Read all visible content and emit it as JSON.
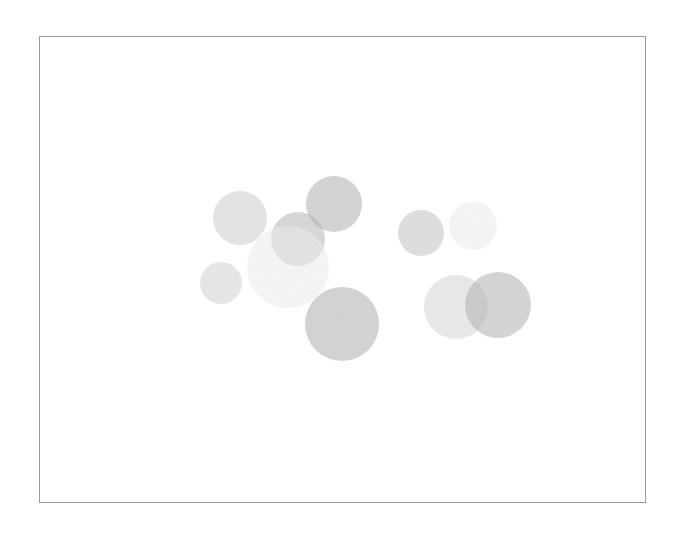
{
  "figure": {
    "background_color": "#ffffff",
    "width": 684,
    "height": 534,
    "title": "",
    "subtitle": ""
  },
  "frame": {
    "name": "plot-frame",
    "x": 39,
    "y": 36,
    "width": 607,
    "height": 467,
    "border_color": "#9a9a9a",
    "border_width": 1,
    "fill_color": "#ffffff"
  },
  "chart_data": {
    "type": "scatter",
    "title": "",
    "subtitle": "",
    "xlabel": "",
    "ylabel": "",
    "xlim": [
      39,
      646
    ],
    "ylim": [
      36,
      503
    ],
    "grid": false,
    "legend": null,
    "tick_labels_x": [],
    "tick_labels_y": [],
    "annotations": [],
    "marker": "circle",
    "marker_edge": "none",
    "marker_alpha": 0.55,
    "points": [
      {
        "id": "bubble-1",
        "label": "",
        "cx": 240,
        "cy": 218,
        "r": 27,
        "color": "#cfcfcf"
      },
      {
        "id": "bubble-2",
        "label": "",
        "cx": 334,
        "cy": 204,
        "r": 28,
        "color": "#b3b3b3"
      },
      {
        "id": "bubble-3",
        "label": "",
        "cx": 298,
        "cy": 239,
        "r": 27,
        "color": "#b8b8b8"
      },
      {
        "id": "bubble-4",
        "label": "",
        "cx": 288,
        "cy": 267,
        "r": 41,
        "color": "#eeeeee"
      },
      {
        "id": "bubble-5",
        "label": "",
        "cx": 221,
        "cy": 283,
        "r": 21,
        "color": "#d5d5d5"
      },
      {
        "id": "bubble-6",
        "label": "",
        "cx": 342,
        "cy": 324,
        "r": 37,
        "color": "#b0b0b0"
      },
      {
        "id": "bubble-7",
        "label": "",
        "cx": 421,
        "cy": 233,
        "r": 23,
        "color": "#c4c4c4"
      },
      {
        "id": "bubble-8",
        "label": "",
        "cx": 473,
        "cy": 226,
        "r": 24,
        "color": "#efefef"
      },
      {
        "id": "bubble-9",
        "label": "",
        "cx": 456,
        "cy": 307,
        "r": 32,
        "color": "#d8d8d8"
      },
      {
        "id": "bubble-10",
        "label": "",
        "cx": 498,
        "cy": 305,
        "r": 33,
        "color": "#b5b5b5"
      }
    ]
  }
}
